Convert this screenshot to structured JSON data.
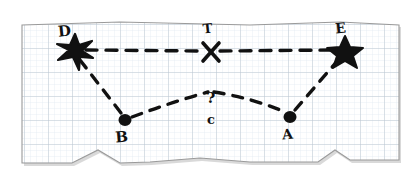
{
  "scene": {
    "title": "hand-drawn route sketch on graph paper",
    "paper": {
      "fill": "#ffffff",
      "border_color": "#9a9a9a",
      "shadow_color": "#b4b4b4",
      "grid_minor_color": "#dfe6ef",
      "grid_major_color": "#b9c3cf",
      "grid_minor_step": 6,
      "grid_major_step": 24,
      "left": 22,
      "top": 22,
      "right": 400,
      "bottom": 166
    },
    "ink_color": "#111111"
  },
  "markers": [
    {
      "id": "D",
      "label": "D",
      "glyph": "star-splat",
      "x": 75,
      "y": 50,
      "label_x": 65,
      "label_y": 36
    },
    {
      "id": "T",
      "label": "T",
      "glyph": "x-cross",
      "x": 211,
      "y": 52,
      "label_x": 208,
      "label_y": 33
    },
    {
      "id": "E",
      "label": "E",
      "glyph": "star-five",
      "x": 345,
      "y": 50,
      "label_x": 341,
      "label_y": 33
    },
    {
      "id": "B",
      "label": "B",
      "glyph": "dot",
      "x": 125,
      "y": 120,
      "label_x": 122,
      "label_y": 142
    },
    {
      "id": "A",
      "label": "A",
      "glyph": "dot",
      "x": 290,
      "y": 117,
      "label_x": 288,
      "label_y": 139
    }
  ],
  "unknown_point": {
    "id": "C",
    "question_mark": "?",
    "label": "c",
    "question_x": 211,
    "question_y": 103,
    "label_x": 211,
    "label_y": 124
  },
  "routes": [
    {
      "id": "D-T",
      "from": "D",
      "to": "T",
      "style": "dashed",
      "path": "M 86 50 L 203 51"
    },
    {
      "id": "T-E",
      "from": "T",
      "to": "E",
      "style": "dashed",
      "path": "M 220 51 L 336 50"
    },
    {
      "id": "D-B",
      "from": "D",
      "to": "B",
      "style": "dashed",
      "path": "M 80 60 L 121 113"
    },
    {
      "id": "B-C",
      "from": "B",
      "to": "C",
      "style": "dashed",
      "path": "M 132 117 Q 175 101 208 92"
    },
    {
      "id": "C-A",
      "from": "C",
      "to": "A",
      "style": "dashed",
      "path": "M 214 92 Q 252 98 285 112"
    },
    {
      "id": "A-E",
      "from": "A",
      "to": "E",
      "style": "dashed",
      "path": "M 295 110 L 339 59"
    }
  ]
}
